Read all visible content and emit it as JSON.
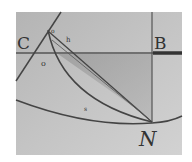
{
  "figure": {
    "background": "#bdbdbd",
    "line_color": "#4a4a4a",
    "labels": {
      "C": "C",
      "B": "B",
      "N": "N",
      "o_small_top": "o",
      "h": "h",
      "o_left": "o",
      "s": "s"
    }
  }
}
